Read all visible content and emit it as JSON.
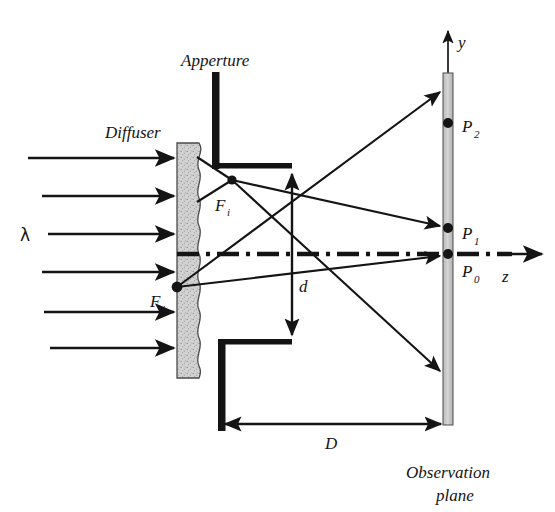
{
  "figure": {
    "background_color": "#ffffff",
    "ink_color": "#141414",
    "diffuser_fill": "#d0d0d0",
    "screen_fill": "#c9c9c9"
  },
  "labels": {
    "apperture": "Apperture",
    "diffuser": "Diffuser",
    "lambda": "λ",
    "f_i": "F",
    "f_i_sub": "i",
    "f_j": "F",
    "f_j_sub": "j",
    "p2": "P",
    "p2_sub": "2",
    "p1": "P",
    "p1_sub": "1",
    "p0": "P",
    "p0_sub": "0",
    "d_small": "d",
    "d_large": "D",
    "axis_y": "y",
    "axis_z": "z",
    "observation_line1": "Observation",
    "observation_line2": "plane"
  },
  "geometry": {
    "incoming_beams_y": [
      158,
      196,
      234,
      272,
      312,
      348
    ],
    "incoming_beam_x_start": 28,
    "incoming_beam_x_end": 177,
    "diffuser": {
      "x": 177,
      "y": 143,
      "width": 22,
      "height": 235
    },
    "aperture_upper_bar": {
      "x": 212,
      "y_top": 72,
      "y_bottom": 167
    },
    "aperture_upper_lip_x_end": 292,
    "aperture_lower_lip_y": 342,
    "aperture_lower_bar": {
      "x": 218,
      "y_top": 342,
      "y_bottom": 430
    },
    "screen": {
      "x": 443,
      "y": 73,
      "width": 10,
      "height": 352
    },
    "optical_axis_y": 254,
    "optical_axis_x_start": 177,
    "optical_axis_x_end": 545,
    "point_f_i": {
      "x": 232,
      "y": 180
    },
    "point_f_j": {
      "x": 177,
      "y": 287
    },
    "point_p2": {
      "x": 448,
      "y": 123
    },
    "point_p1": {
      "x": 448,
      "y": 228
    },
    "point_p0": {
      "x": 448,
      "y": 254
    },
    "ray_fi_to_p1_end_y": 228,
    "ray_fi_to_lower_end_y": 372,
    "ray_fj_to_top_end_y": 93,
    "ray_fj_to_p0_end_y": 254,
    "d_arrow_x": 292,
    "d_arrow_y_top": 167,
    "d_arrow_y_bottom": 342,
    "big_d_arrow_y": 424,
    "big_d_arrow_x_left": 218,
    "big_d_arrow_x_right": 443,
    "y_axis_top": 28,
    "z_axis_arrow_x_end": 545
  }
}
